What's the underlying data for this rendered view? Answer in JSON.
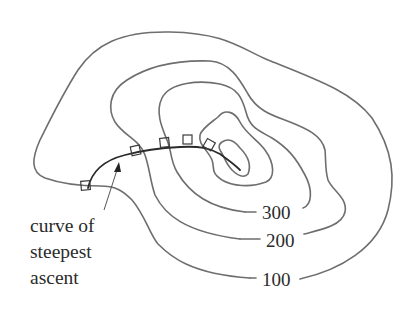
{
  "diagram": {
    "type": "contour-map",
    "contour_labels": [
      {
        "id": "c100",
        "value": "100"
      },
      {
        "id": "c200",
        "value": "200"
      },
      {
        "id": "c300",
        "value": "300"
      }
    ],
    "caption": {
      "line1": "curve of",
      "line2": "steepest",
      "line3": "ascent"
    },
    "colors": {
      "contour": "#6e6e6e",
      "ascent_curve": "#2a2a2a",
      "text": "#2b2b2b",
      "background": "#ffffff"
    }
  }
}
